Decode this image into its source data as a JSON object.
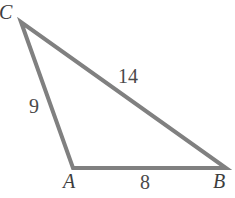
{
  "figure": {
    "type": "triangle-diagram",
    "background_color": "#ffffff",
    "stroke_color": "#808080",
    "stroke_width": 4,
    "label_color": "#4a4a4a",
    "vertices": {
      "C": {
        "label": "C",
        "x": 21,
        "y": 22
      },
      "A": {
        "label": "A",
        "x": 73,
        "y": 168
      },
      "B": {
        "label": "B",
        "x": 226,
        "y": 168
      }
    },
    "sides": [
      {
        "name": "CA",
        "label": "9",
        "from": "C",
        "to": "A"
      },
      {
        "name": "CB",
        "label": "14",
        "from": "C",
        "to": "B"
      },
      {
        "name": "AB",
        "label": "8",
        "from": "A",
        "to": "B"
      }
    ],
    "vertex_labels": {
      "C": "C",
      "A": "A",
      "B": "B"
    },
    "side_labels": {
      "CA": "9",
      "CB": "14",
      "AB": "8"
    }
  }
}
